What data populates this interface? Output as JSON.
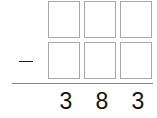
{
  "problem": {
    "operator": "−",
    "operator_name": "subtraction",
    "top_row": [
      "",
      "",
      ""
    ],
    "bottom_row": [
      "",
      "",
      ""
    ],
    "result": [
      "3",
      "8",
      "3"
    ]
  }
}
